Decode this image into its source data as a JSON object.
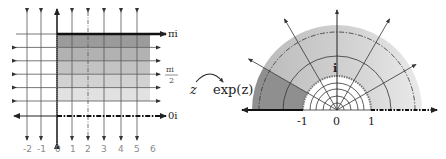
{
  "figure": {
    "mapping_label": {
      "source": "z",
      "target": "exp(z)"
    },
    "left_panel": {
      "title": "z-plane strip",
      "x_tick_labels": [
        "-2",
        "-1",
        "0",
        "1",
        "2",
        "3",
        "4",
        "5",
        "6"
      ],
      "y_labels": {
        "top": "πi",
        "middle_numerator": "πi",
        "middle_denominator": "2",
        "bottom": "0i"
      },
      "shading_bands": [
        "#9b9b9b",
        "#b2b2b2",
        "#c3c3c3",
        "#d2d2d2",
        "#e2e2e2"
      ]
    },
    "right_panel": {
      "title": "w-plane half annulus",
      "real_axis_labels": [
        "-1",
        "0",
        "1"
      ],
      "imag_label": "i",
      "shading": {
        "dark_sector": "#8f8f8f",
        "light_sector_left": "#c4c4c4",
        "light_sector_right": "#e4e4e4"
      }
    },
    "colors": {
      "line": "#333333",
      "grid": "#555555",
      "label_gray": "#8a8a8a"
    }
  }
}
